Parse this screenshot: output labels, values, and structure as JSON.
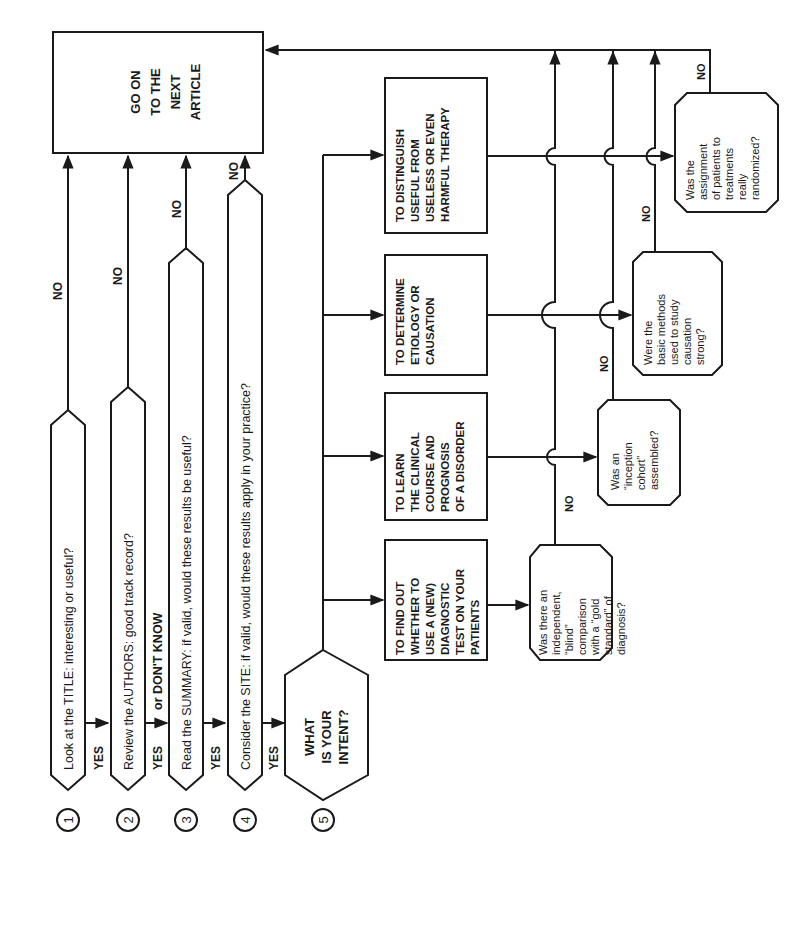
{
  "diagram": {
    "orientation": "rotated-90-ccw",
    "ink_color": "#1a1a1a",
    "background": "#ffffff",
    "terminal": {
      "lines": [
        "GO ON",
        "TO THE",
        "NEXT",
        "ARTICLE"
      ]
    },
    "steps": [
      {
        "number": "1",
        "text": "Look at the TITLE:  interesting or useful?",
        "no_label": "NO",
        "yes_label": "YES"
      },
      {
        "number": "2",
        "text": "Review the AUTHORS:  good track record?",
        "no_label": "NO",
        "yes_label": "YES",
        "yes_extra": "or DON'T KNOW"
      },
      {
        "number": "3",
        "text": "Read the SUMMARY:  if valid, would these results be useful?",
        "no_label": "NO",
        "yes_label": "YES"
      },
      {
        "number": "4",
        "text": "Consider the SITE:  if valid, would these results apply in your practice?",
        "no_label": "NO",
        "yes_label": "YES"
      },
      {
        "number": "5",
        "lines": [
          "WHAT",
          "IS YOUR",
          "INTENT?"
        ]
      }
    ],
    "intents": [
      {
        "id": "diagnostic",
        "lines": [
          "TO FIND OUT",
          "WHETHER TO",
          "USE A (NEW)",
          "DIAGNOSTIC",
          "TEST ON YOUR",
          "PATIENTS"
        ],
        "question": [
          "Was there an",
          "independent,",
          "“blind”",
          "comparison",
          "with a “gold",
          "standard” of",
          "diagnosis?"
        ],
        "no_label": "NO"
      },
      {
        "id": "prognosis",
        "lines": [
          "TO LEARN",
          "THE CLINICAL",
          "COURSE AND",
          "PROGNOSIS",
          "OF A DISORDER"
        ],
        "question": [
          "Was an",
          "“inception",
          "cohort”",
          "assembled?"
        ],
        "no_label": "NO"
      },
      {
        "id": "etiology",
        "lines": [
          "TO DETERMINE",
          "ETIOLOGY OR",
          "CAUSATION"
        ],
        "question": [
          "Were the",
          "basic methods",
          "used to study",
          "causation",
          "strong?"
        ],
        "no_label": "NO"
      },
      {
        "id": "therapy",
        "lines": [
          "TO DISTINGUISH",
          "USEFUL FROM",
          "USELESS OR EVEN",
          "HARMFUL THERAPY"
        ],
        "question": [
          "Was the",
          "assignment",
          "of patients to",
          "treatments",
          "really",
          "randomized?"
        ],
        "no_label": "NO"
      }
    ]
  }
}
